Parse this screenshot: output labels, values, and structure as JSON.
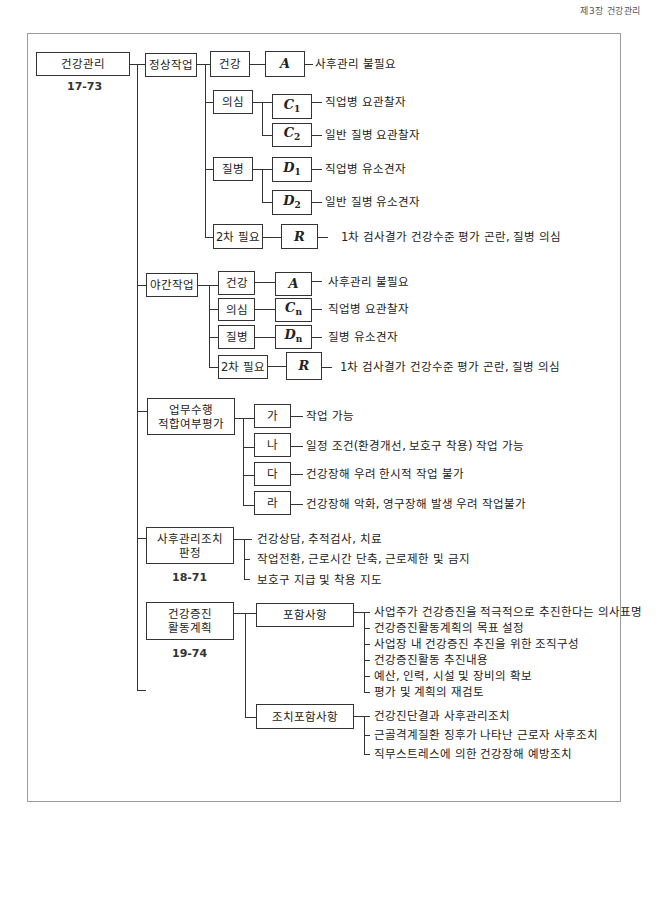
{
  "page_header": "제3장 건강관리",
  "root": {
    "label": "건강관리",
    "code": "17-73"
  },
  "normal_work": {
    "label": "정상작업",
    "items": [
      {
        "status": "건강",
        "var": "A",
        "sub": "",
        "desc": "사후관리 불필요"
      },
      {
        "status": "의심",
        "branches": [
          {
            "var": "C",
            "sub": "1",
            "desc": "직업병 요관찰자"
          },
          {
            "var": "C",
            "sub": "2",
            "desc": "일반 질병 요관찰자"
          }
        ]
      },
      {
        "status": "질병",
        "branches": [
          {
            "var": "D",
            "sub": "1",
            "desc": "직업병 유소견자"
          },
          {
            "var": "D",
            "sub": "2",
            "desc": "일반 질병 유소견자"
          }
        ]
      },
      {
        "status": "2차 필요",
        "var": "R",
        "sub": "",
        "desc": "1차 검사결가 건강수준 평가 곤란, 질병 의심"
      }
    ]
  },
  "night_work": {
    "label": "야간작업",
    "items": [
      {
        "status": "건강",
        "var": "A",
        "sub": "",
        "desc": "사후관리 불필요"
      },
      {
        "status": "의심",
        "var": "C",
        "sub": "n",
        "desc": "직업병 요관찰자"
      },
      {
        "status": "질병",
        "var": "D",
        "sub": "n",
        "desc": "질병 유소견자"
      },
      {
        "status": "2차 필요",
        "var": "R",
        "sub": "",
        "desc": "1차 검사결가 건강수준 평가 곤란, 질병 의심"
      }
    ]
  },
  "fitness": {
    "label_line1": "업무수행",
    "label_line2": "적합여부평가",
    "items": [
      {
        "grade": "가",
        "desc": "작업 가능"
      },
      {
        "grade": "나",
        "desc": "일정 조건(환경개선, 보호구 착용) 작업 가능"
      },
      {
        "grade": "다",
        "desc": "건강장해 우려 한시적 작업 불가"
      },
      {
        "grade": "라",
        "desc": "건강장해 악화, 영구장해 발생 우려 작업불가"
      }
    ]
  },
  "followup": {
    "label_line1": "사후관리조치",
    "label_line2": "판정",
    "code": "18-71",
    "items": [
      "건강상담, 추적검사, 치료",
      "작업전환, 근로시간 단축, 근로제한 및 금지",
      "보호구 지급 및 착용 지도"
    ]
  },
  "promotion": {
    "label_line1": "건강증진",
    "label_line2": "활동계획",
    "code": "19-74",
    "included": {
      "label": "포함사항",
      "items": [
        "사업주가 건강증진을 적극적으로 추진한다는 의사표명",
        "건강증진활동계획의 목표 설정",
        "사업장 내 건강증진 추진을 위한 조직구성",
        "건강증진활동 추진내용",
        "예산, 인력, 시설 및 장비의 확보",
        "평가 및 계획의 재검토"
      ]
    },
    "measures": {
      "label": "조치포함사항",
      "items": [
        "건강진단결과 사후관리조치",
        "근골격계질환 징후가 나타난 근로자 사후조치",
        "직무스트레스에 의한 건강장해 예방조치"
      ]
    }
  }
}
